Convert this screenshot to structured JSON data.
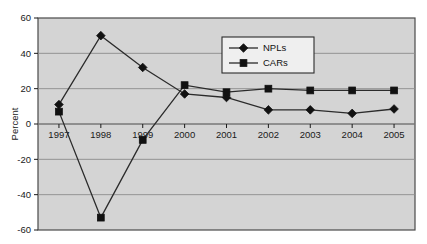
{
  "chart_data": {
    "type": "line",
    "title": "",
    "xlabel": "",
    "ylabel": "Percent",
    "categories": [
      "1997",
      "1998",
      "1999",
      "2000",
      "2001",
      "2002",
      "2003",
      "2004",
      "2005"
    ],
    "ylim": [
      -60,
      60
    ],
    "yticks": [
      60,
      40,
      20,
      0,
      -20,
      -40,
      -60
    ],
    "ytick_labels": [
      "60",
      "40",
      "20",
      "0",
      "-20",
      "-40",
      "-60"
    ],
    "grid": true,
    "grid_axis": "y",
    "legend_position": "upper-right-inside",
    "plot_background": "#d4d4d4",
    "series": [
      {
        "name": "NPLs",
        "marker": "diamond",
        "color": "#1a1a1a",
        "values": [
          11,
          50,
          32,
          17,
          15,
          8,
          8,
          6,
          8.5
        ]
      },
      {
        "name": "CARs",
        "marker": "square",
        "color": "#1a1a1a",
        "values": [
          7,
          -53,
          -9,
          22,
          18,
          20,
          19,
          19,
          19
        ]
      }
    ]
  },
  "legend": {
    "entries": [
      {
        "label": "NPLs",
        "marker": "diamond"
      },
      {
        "label": "CARs",
        "marker": "square"
      }
    ]
  },
  "axes": {
    "y_title": "Percent"
  },
  "colors": {
    "plot_fill": "#d4d4d4",
    "plot_border": "#4a4a4a",
    "gridline": "#8c8c8c",
    "series_line": "#2b2b2b",
    "marker_fill": "#111111",
    "legend_fill": "#efefef",
    "legend_border": "#2b2b2b",
    "text": "#1a1a1a",
    "page_background": "#ffffff"
  }
}
